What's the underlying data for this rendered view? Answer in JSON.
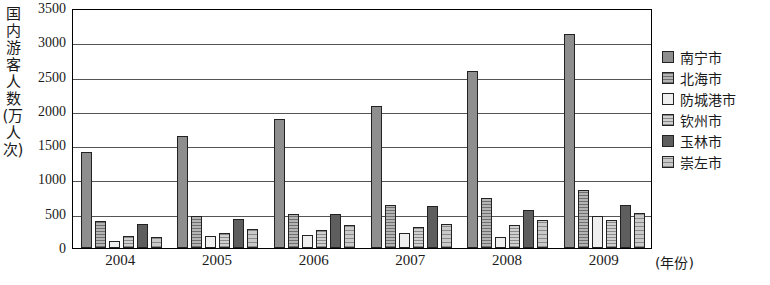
{
  "chart_data": {
    "type": "bar",
    "title": "",
    "xlabel": "(年份)",
    "ylabel": "国内游客人数(万人次)",
    "categories": [
      "2004",
      "2005",
      "2006",
      "2007",
      "2008",
      "2009"
    ],
    "ylim": [
      0,
      3500
    ],
    "yticks": [
      0,
      500,
      1000,
      1500,
      2000,
      2500,
      3000,
      3500
    ],
    "grid": true,
    "legend_position": "right",
    "series": [
      {
        "name": "南宁市",
        "values": [
          1400,
          1640,
          1880,
          2070,
          2580,
          3120
        ]
      },
      {
        "name": "北海市",
        "values": [
          400,
          460,
          500,
          630,
          730,
          850
        ]
      },
      {
        "name": "防城港市",
        "values": [
          105,
          175,
          195,
          215,
          155,
          470
        ]
      },
      {
        "name": "钦州市",
        "values": [
          175,
          225,
          270,
          300,
          330,
          410
        ]
      },
      {
        "name": "玉林市",
        "values": [
          355,
          420,
          500,
          620,
          550,
          630
        ]
      },
      {
        "name": "崇左市",
        "values": [
          160,
          275,
          330,
          355,
          410,
          510
        ]
      }
    ]
  },
  "ylabel_chars": "国内游客人数(万人次)",
  "axis": {
    "y_unit_label": "国内\n游客\n人数\n(万\n人次\n)",
    "x_unit_label": "(年份)"
  }
}
